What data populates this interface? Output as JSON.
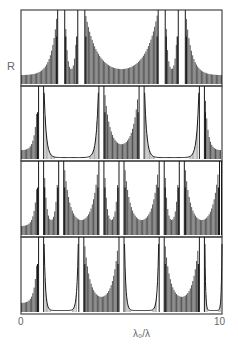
{
  "labels": {
    "y_axis": "R",
    "x_min": "0",
    "x_max": "10",
    "x_axis": "λ₀/λ"
  },
  "colors": {
    "ink": "#1a1a1a",
    "frame": "#444444",
    "paper": "#ffffff"
  },
  "chart_data": {
    "type": "line",
    "title": "",
    "xlabel": "λ₀/λ",
    "ylabel": "R",
    "xlim": [
      0,
      10
    ],
    "ylim": [
      0,
      1
    ],
    "grid": false,
    "legend": null,
    "panels": [
      {
        "name": "panel-1",
        "bands": [
          {
            "from": 0.0,
            "to": 1.8,
            "type": "ripple",
            "edge": "right"
          },
          {
            "from": 1.8,
            "to": 2.2,
            "type": "stop"
          },
          {
            "from": 2.2,
            "to": 2.8,
            "type": "ripple",
            "edge": "both"
          },
          {
            "from": 2.8,
            "to": 3.2,
            "type": "stop"
          },
          {
            "from": 3.2,
            "to": 6.8,
            "type": "ripple",
            "edge": "both"
          },
          {
            "from": 6.8,
            "to": 7.2,
            "type": "stop"
          },
          {
            "from": 7.2,
            "to": 7.8,
            "type": "ripple",
            "edge": "both"
          },
          {
            "from": 7.8,
            "to": 8.2,
            "type": "stop"
          },
          {
            "from": 8.2,
            "to": 10.0,
            "type": "ripple",
            "edge": "left"
          }
        ]
      },
      {
        "name": "panel-2",
        "bands": [
          {
            "from": 0.0,
            "to": 0.85,
            "type": "ripple",
            "edge": "right"
          },
          {
            "from": 0.85,
            "to": 1.15,
            "type": "stop"
          },
          {
            "from": 1.15,
            "to": 3.85,
            "type": "flat"
          },
          {
            "from": 3.85,
            "to": 4.15,
            "type": "stop"
          },
          {
            "from": 4.15,
            "to": 5.85,
            "type": "ripple",
            "edge": "both"
          },
          {
            "from": 5.85,
            "to": 6.15,
            "type": "stop"
          },
          {
            "from": 6.15,
            "to": 8.85,
            "type": "flat"
          },
          {
            "from": 8.85,
            "to": 9.15,
            "type": "stop"
          },
          {
            "from": 9.15,
            "to": 10.0,
            "type": "ripple",
            "edge": "left"
          }
        ]
      },
      {
        "name": "panel-3",
        "bands": [
          {
            "from": 0.0,
            "to": 0.85,
            "type": "ripple",
            "edge": "right"
          },
          {
            "from": 0.85,
            "to": 1.15,
            "type": "stop"
          },
          {
            "from": 1.15,
            "to": 1.85,
            "type": "ripple",
            "edge": "both"
          },
          {
            "from": 1.85,
            "to": 2.15,
            "type": "stop"
          },
          {
            "from": 2.15,
            "to": 3.85,
            "type": "ripple",
            "edge": "both"
          },
          {
            "from": 3.85,
            "to": 4.15,
            "type": "stop"
          },
          {
            "from": 4.15,
            "to": 4.85,
            "type": "ripple",
            "edge": "both"
          },
          {
            "from": 4.85,
            "to": 5.15,
            "type": "stop"
          },
          {
            "from": 5.15,
            "to": 6.85,
            "type": "ripple",
            "edge": "both"
          },
          {
            "from": 6.85,
            "to": 7.15,
            "type": "stop"
          },
          {
            "from": 7.15,
            "to": 7.85,
            "type": "ripple",
            "edge": "both"
          },
          {
            "from": 7.85,
            "to": 8.15,
            "type": "stop"
          },
          {
            "from": 8.15,
            "to": 9.85,
            "type": "ripple",
            "edge": "both"
          },
          {
            "from": 9.85,
            "to": 10.0,
            "type": "stop"
          }
        ]
      },
      {
        "name": "panel-4",
        "bands": [
          {
            "from": 0.0,
            "to": 0.85,
            "type": "ripple",
            "edge": "right"
          },
          {
            "from": 0.85,
            "to": 1.15,
            "type": "stop"
          },
          {
            "from": 1.15,
            "to": 2.85,
            "type": "flat"
          },
          {
            "from": 2.85,
            "to": 3.15,
            "type": "stop"
          },
          {
            "from": 3.15,
            "to": 4.85,
            "type": "ripple",
            "edge": "both"
          },
          {
            "from": 4.85,
            "to": 5.15,
            "type": "stop"
          },
          {
            "from": 5.15,
            "to": 6.85,
            "type": "flat"
          },
          {
            "from": 6.85,
            "to": 7.15,
            "type": "stop"
          },
          {
            "from": 7.15,
            "to": 8.85,
            "type": "ripple",
            "edge": "both"
          },
          {
            "from": 8.85,
            "to": 9.15,
            "type": "stop"
          },
          {
            "from": 9.15,
            "to": 10.0,
            "type": "flat"
          }
        ]
      }
    ]
  }
}
